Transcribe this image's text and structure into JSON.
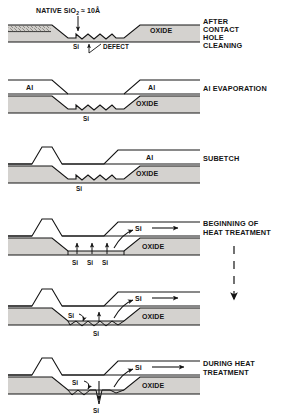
{
  "figure": {
    "title_note": "NATIVE SiO2 = 10A",
    "top_annotation": {
      "prefix": "NATIVE SiO",
      "subscript": "2",
      "suffix": "≈ 10Å"
    },
    "colors": {
      "line": "#141414",
      "oxide_fill": "#d4d2cf",
      "si_fill": "#ffffff",
      "al_fill": "#ffffff",
      "native_oxide_fill": "#cfcdc9",
      "background": "#ffffff"
    },
    "process_arrow": {
      "style": "dashed-down-arrow",
      "meaning": "time / process progression"
    },
    "panels": [
      {
        "index": 1,
        "right_label_lines": [
          "AFTER",
          "CONTACT",
          "HOLE",
          "CLEANING"
        ],
        "inner_labels": [
          "OXIDE"
        ],
        "small_labels": [
          "Si",
          "DEFECT"
        ],
        "has_native_oxide_hatch": true,
        "has_al": false,
        "description": "Contact hole etched through oxide down to Si; scalloped Si surface with a defect notch; native SiO2 ~10A remains"
      },
      {
        "index": 2,
        "right_label_lines": [
          "Al EVAPORATION"
        ],
        "inner_labels": [
          "Al",
          "Al",
          "OXIDE"
        ],
        "small_labels": [
          "Si"
        ],
        "has_native_oxide_hatch": false,
        "has_al": true,
        "description": "Aluminium film evaporated conformally over oxide and into contact hole"
      },
      {
        "index": 3,
        "right_label_lines": [
          "SUBETCH"
        ],
        "inner_labels": [
          "Al",
          "OXIDE"
        ],
        "small_labels": [
          "Si"
        ],
        "has_native_oxide_hatch": false,
        "has_al": true,
        "description": "Aluminium subetched; left shoulder forms a raised peak over the oxide step"
      },
      {
        "index": 4,
        "right_label_lines": [
          "BEGINNING OF",
          "HEAT TREATMENT"
        ],
        "inner_labels": [
          "Si",
          "OXIDE"
        ],
        "small_labels": [
          "Si",
          "Si",
          "Si"
        ],
        "arrow_count_up": 3,
        "has_native_oxide_hatch": false,
        "has_al": true,
        "description": "Silicon begins dissolving into the aluminium; upward arrows show Si diffusing out of the contact, lateral arrow shows Si transport along the Al film"
      },
      {
        "index": 5,
        "right_label_lines": [],
        "inner_labels": [
          "Si",
          "OXIDE"
        ],
        "small_labels": [
          "Si",
          "Si"
        ],
        "has_native_oxide_hatch": false,
        "has_al": true,
        "description": "Continued dissolution; Si consumed locally, pits deepen beneath contact"
      },
      {
        "index": 6,
        "right_label_lines": [
          "DURING HEAT",
          "TREATMENT"
        ],
        "inner_labels": [
          "Si",
          "OXIDE"
        ],
        "small_labels": [
          "Si",
          "Si"
        ],
        "has_native_oxide_hatch": false,
        "has_al": true,
        "description": "Deep Al spike penetrates into the silicon substrate during heat treatment"
      }
    ]
  }
}
